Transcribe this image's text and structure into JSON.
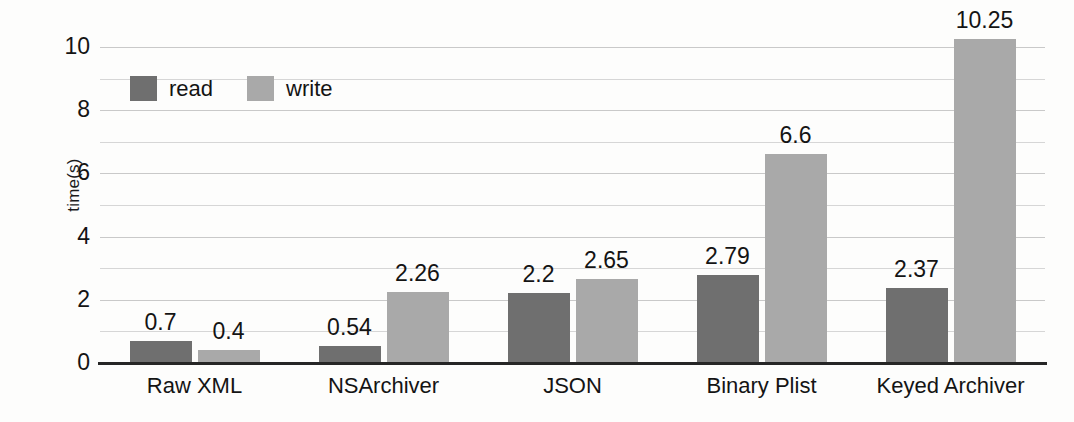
{
  "chart_data": {
    "type": "bar",
    "title": "",
    "xlabel": "",
    "ylabel": "time(s)",
    "ylim": [
      0,
      10.6
    ],
    "ytick_labels": [
      "0",
      "2",
      "4",
      "6",
      "8",
      "10"
    ],
    "ytick_values": [
      0,
      2,
      4,
      6,
      8,
      10
    ],
    "grid": "horizontal gridlines every 1 unit, light gray",
    "legend_position": "inside top-left of plot area",
    "categories": [
      "Raw XML",
      "NSArchiver",
      "JSON",
      "Binary Plist",
      "Keyed Archiver"
    ],
    "series": [
      {
        "name": "read",
        "color": "#6f6f6f",
        "values": [
          0.7,
          0.54,
          2.2,
          2.79,
          2.37
        ],
        "labels": [
          "0.7",
          "0.54",
          "2.2",
          "2.79",
          "2.37"
        ]
      },
      {
        "name": "write",
        "color": "#a9a9a9",
        "values": [
          0.4,
          2.26,
          2.65,
          6.6,
          10.25
        ],
        "labels": [
          "0.4",
          "2.26",
          "2.65",
          "6.6",
          "10.25"
        ]
      }
    ]
  },
  "axis": {
    "y_title": "time(s)"
  },
  "legend": {
    "items": [
      {
        "label": "read",
        "swatch": "read-swatch"
      },
      {
        "label": "write",
        "swatch": "write-swatch"
      }
    ]
  },
  "colors": {
    "read": "#6f6f6f",
    "write": "#a9a9a9",
    "gridline": "#d6d6d6",
    "axis": "#262626",
    "background": "#fdfdfc",
    "text": "#141414"
  }
}
